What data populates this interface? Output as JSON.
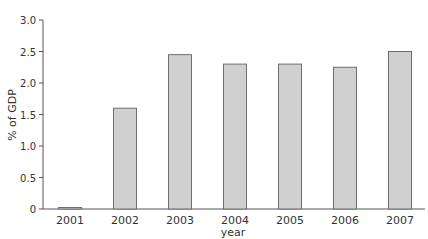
{
  "chart_data": {
    "type": "bar",
    "title": "",
    "xlabel": "year",
    "ylabel": "% of GDP",
    "categories": [
      "2001",
      "2002",
      "2003",
      "2004",
      "2005",
      "2006",
      "2007"
    ],
    "values": [
      0.02,
      1.6,
      2.45,
      2.3,
      2.3,
      2.25,
      2.5
    ],
    "ylim": [
      0,
      3.0
    ],
    "yticks": [
      "0",
      "0.5",
      "1.0",
      "1.5",
      "2.0",
      "2.5",
      "3.0"
    ],
    "grid": false,
    "legend": null,
    "colors": {
      "bar_fill": "#d0d0d0",
      "bar_stroke": "#6e6e6e",
      "axis": "#555555"
    }
  }
}
